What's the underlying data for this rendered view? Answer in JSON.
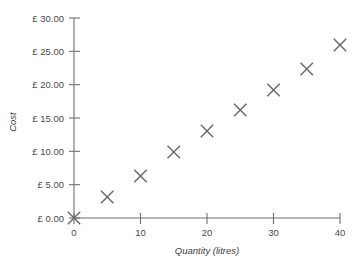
{
  "chart_data": {
    "type": "scatter",
    "title": "",
    "xlabel": "Quantity (litres)",
    "ylabel": "Cost",
    "xlim": [
      0,
      40
    ],
    "ylim": [
      0,
      30
    ],
    "grid": false,
    "legend": null,
    "x": [
      0,
      5,
      10,
      15,
      20,
      25,
      30,
      35,
      40
    ],
    "values": [
      0.0,
      3.15,
      6.3,
      9.9,
      13.05,
      16.2,
      19.2,
      22.35,
      25.95
    ],
    "series": [
      {
        "name": "Cost vs Quantity",
        "marker": "x",
        "color": "#6a6a6a",
        "points": [
          {
            "x": 0,
            "y": 0.0
          },
          {
            "x": 5,
            "y": 3.15
          },
          {
            "x": 10,
            "y": 6.3
          },
          {
            "x": 15,
            "y": 9.9
          },
          {
            "x": 20,
            "y": 13.05
          },
          {
            "x": 25,
            "y": 16.2
          },
          {
            "x": 30,
            "y": 19.2
          },
          {
            "x": 35,
            "y": 22.35
          },
          {
            "x": 40,
            "y": 25.95
          }
        ]
      }
    ],
    "x_tick_values": [
      0,
      10,
      20,
      30,
      40
    ],
    "x_tick_labels": [
      "0",
      "10",
      "20",
      "30",
      "40"
    ],
    "y_tick_values": [
      0,
      5,
      10,
      15,
      20,
      25,
      30
    ],
    "y_tick_labels": [
      "£ 0.00",
      "£ 5.00",
      "£ 10.00",
      "£ 15.00",
      "£ 20.00",
      "£ 25.00",
      "£ 30.00"
    ],
    "colors": {
      "background": "#ffffff",
      "axis": "#6e6e6e",
      "marker": "#6a6a6a",
      "tick_text": "#4a4a4a",
      "axis_title_text": "#3c3c3c"
    }
  }
}
